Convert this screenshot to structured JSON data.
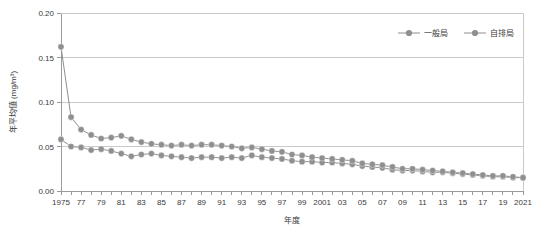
{
  "chart_data": {
    "type": "line",
    "title": "",
    "xlabel": "年度",
    "ylabel": "年平均値 (mg/m³)",
    "ylim": [
      0.0,
      0.2
    ],
    "yticks": [
      "0.00",
      "0.05",
      "0.10",
      "0.15",
      "0.20"
    ],
    "ytick_values": [
      0.0,
      0.05,
      0.1,
      0.15,
      0.2
    ],
    "grid": true,
    "legend_position": "top-right",
    "x": [
      1975,
      1976,
      1977,
      1978,
      1979,
      1980,
      1981,
      1982,
      1983,
      1984,
      1985,
      1986,
      1987,
      1988,
      1989,
      1990,
      1991,
      1992,
      1993,
      1994,
      1995,
      1996,
      1997,
      1998,
      1999,
      2000,
      2001,
      2002,
      2003,
      2004,
      2005,
      2006,
      2007,
      2008,
      2009,
      2010,
      2011,
      2012,
      2013,
      2014,
      2015,
      2016,
      2017,
      2018,
      2019,
      2020,
      2021
    ],
    "xtick_labels": [
      "1975",
      "",
      "77",
      "",
      "79",
      "",
      "81",
      "",
      "83",
      "",
      "85",
      "",
      "87",
      "",
      "89",
      "",
      "91",
      "",
      "93",
      "",
      "95",
      "",
      "97",
      "",
      "99",
      "",
      "2001",
      "",
      "03",
      "",
      "05",
      "",
      "07",
      "",
      "09",
      "",
      "11",
      "",
      "13",
      "",
      "15",
      "",
      "17",
      "",
      "19",
      "",
      "2021"
    ],
    "series": [
      {
        "name": "一般局",
        "color": "#8f8f8f",
        "values": [
          0.058,
          0.05,
          0.049,
          0.046,
          0.047,
          0.045,
          0.042,
          0.039,
          0.041,
          0.042,
          0.04,
          0.039,
          0.038,
          0.037,
          0.038,
          0.038,
          0.037,
          0.038,
          0.037,
          0.04,
          0.038,
          0.037,
          0.036,
          0.034,
          0.033,
          0.033,
          0.032,
          0.032,
          0.031,
          0.03,
          0.028,
          0.027,
          0.026,
          0.024,
          0.023,
          0.023,
          0.022,
          0.021,
          0.021,
          0.02,
          0.019,
          0.018,
          0.017,
          0.016,
          0.016,
          0.015,
          0.015
        ]
      },
      {
        "name": "自排局",
        "color": "#8f8f8f",
        "values": [
          0.162,
          0.083,
          0.069,
          0.063,
          0.059,
          0.06,
          0.062,
          0.058,
          0.055,
          0.053,
          0.052,
          0.051,
          0.052,
          0.051,
          0.052,
          0.052,
          0.051,
          0.05,
          0.048,
          0.049,
          0.047,
          0.045,
          0.044,
          0.041,
          0.04,
          0.038,
          0.037,
          0.036,
          0.035,
          0.034,
          0.031,
          0.03,
          0.029,
          0.027,
          0.025,
          0.025,
          0.024,
          0.023,
          0.022,
          0.021,
          0.02,
          0.019,
          0.018,
          0.017,
          0.017,
          0.016,
          0.015
        ]
      }
    ]
  },
  "legend": {
    "items": [
      {
        "label": "一般局"
      },
      {
        "label": "自排局"
      }
    ]
  }
}
